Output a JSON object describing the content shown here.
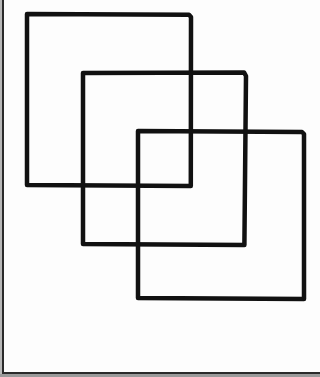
{
  "diagram": {
    "stroke_color": "#111111",
    "background": "#fdfdfd",
    "frame_color": "#2a2a2a",
    "squares": [
      {
        "name": "square-1",
        "x": 27,
        "y": 14,
        "width": 164,
        "height": 172
      },
      {
        "name": "square-2",
        "x": 83,
        "y": 73,
        "width": 163,
        "height": 172
      },
      {
        "name": "square-3",
        "x": 138,
        "y": 131,
        "width": 166,
        "height": 168
      }
    ]
  }
}
